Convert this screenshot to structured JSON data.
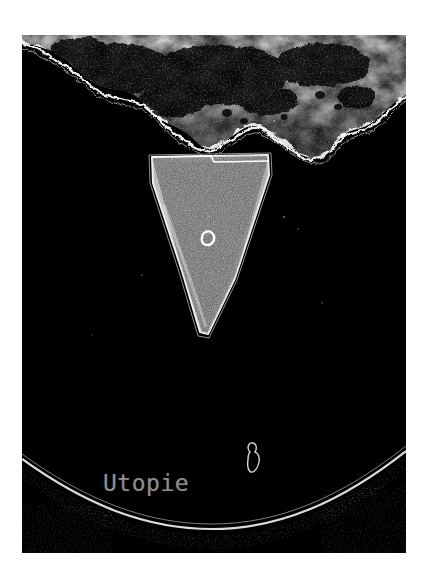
{
  "artwork": {
    "title": "Utopie",
    "medium_background": "#ffffff",
    "plate_background": "#000000",
    "caption": {
      "text": "Utopie",
      "color": "#8d8d8d"
    },
    "elements": [
      {
        "name": "cloud-burst",
        "description": "bright irregular cloud / explosion mass along the upper edge"
      },
      {
        "name": "wedge-shape",
        "description": "downward pointing triangular grainy wedge with bright outline"
      },
      {
        "name": "ring-mark",
        "description": "small white ring near the centre of the wedge"
      },
      {
        "name": "horizon-arc",
        "description": "thin bright curved arc sweeping across the lower third"
      },
      {
        "name": "blob-mark",
        "description": "small outlined footprint-like blob right of the caption"
      }
    ],
    "colors": {
      "highlight": "#ffffff",
      "wedge_fill": "#6a6a6a",
      "arc_stroke": "#d9d9d9",
      "paper": "#ffffff",
      "ink": "#000000"
    }
  }
}
